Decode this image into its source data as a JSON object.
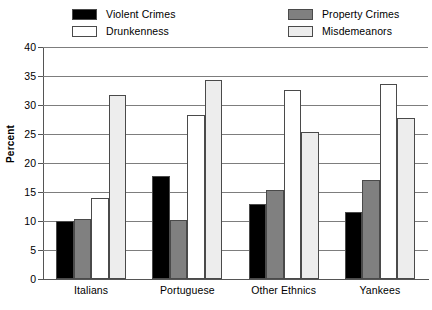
{
  "chart_data": {
    "type": "bar",
    "title": "",
    "xlabel": "",
    "ylabel": "Percent",
    "ylim": [
      0,
      40
    ],
    "yticks": [
      0,
      5,
      10,
      15,
      20,
      25,
      30,
      35,
      40
    ],
    "grid": true,
    "legend_position": "top",
    "categories": [
      "Italians",
      "Portuguese",
      "Other Ethnics",
      "Yankees"
    ],
    "series": [
      {
        "name": "Violent Crimes",
        "color": "#000000",
        "values": [
          10.0,
          17.8,
          13.0,
          11.5
        ]
      },
      {
        "name": "Property Crimes",
        "color": "#808080",
        "values": [
          10.3,
          10.1,
          15.3,
          17.1
        ]
      },
      {
        "name": "Drunkenness",
        "color": "#ffffff",
        "values": [
          13.9,
          28.2,
          32.6,
          33.6
        ]
      },
      {
        "name": "Misdemeanors",
        "color": "#ededed",
        "values": [
          31.7,
          34.3,
          25.3,
          27.8
        ]
      }
    ]
  },
  "legend": {
    "items": [
      {
        "label": "Violent Crimes",
        "swatch": "#000000"
      },
      {
        "label": "Drunkenness",
        "swatch": "#ffffff"
      },
      {
        "label": "Property Crimes",
        "swatch": "#808080"
      },
      {
        "label": "Misdemeanors",
        "swatch": "#ededed"
      }
    ]
  }
}
